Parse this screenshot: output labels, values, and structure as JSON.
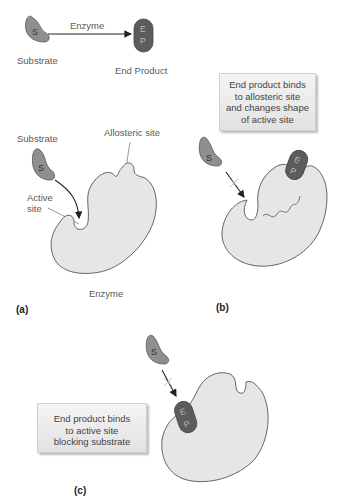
{
  "top": {
    "substrate_glyph": "S",
    "substrate_label": "Substrate",
    "arrow_label": "Enzyme",
    "product_glyph_e": "E",
    "product_glyph_p": "P",
    "product_label": "End Product"
  },
  "panel_a": {
    "tag": "(a)",
    "substrate_label": "Substrate",
    "substrate_glyph": "S",
    "allosteric_label": "Allosteric site",
    "active_label_1": "Active",
    "active_label_2": "site",
    "enzyme_label": "Enzyme"
  },
  "panel_b": {
    "tag": "(b)",
    "callout_lines": [
      "End product binds",
      "to allosteric site",
      "and changes shape",
      "of active site"
    ],
    "substrate_glyph": "S",
    "product_glyph_e": "E",
    "product_glyph_p": "P"
  },
  "panel_c": {
    "tag": "(c)",
    "callout_lines": [
      "End product binds",
      "to active site",
      "blocking substrate"
    ],
    "substrate_glyph": "S",
    "product_glyph_e": "E",
    "product_glyph_p": "P"
  },
  "colors": {
    "substrate_fill": "#8f8f8f",
    "product_fill": "#5c5c5c",
    "enzyme_fill": "#e6e6e6",
    "outline": "#555555",
    "callout_bg": "#ebebeb"
  }
}
